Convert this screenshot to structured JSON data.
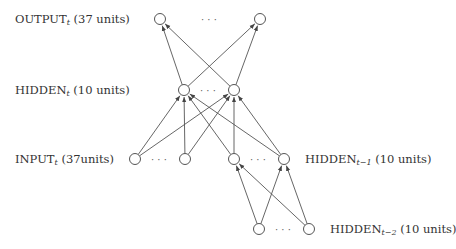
{
  "diagram": {
    "type": "recurrent-neural-network-architecture",
    "stroke_color": "#555555",
    "layers": [
      {
        "id": "output",
        "name": "OUTPUT",
        "subscript": "t",
        "suffix": "(37 units)",
        "nodes": [
          [
            160,
            19
          ],
          [
            260,
            19
          ]
        ],
        "dots": [
          210,
          19
        ],
        "label_pos": [
          15,
          12
        ]
      },
      {
        "id": "hidden_t",
        "name": "HIDDEN",
        "subscript": "t",
        "suffix": "(10 units)",
        "nodes": [
          [
            184,
            90
          ],
          [
            234,
            90
          ]
        ],
        "dots": [
          209,
          90
        ],
        "label_pos": [
          15,
          83
        ]
      },
      {
        "id": "input",
        "name": "INPUT",
        "subscript": "t",
        "suffix": "(37units)",
        "nodes": [
          [
            135,
            159
          ],
          [
            185,
            159
          ]
        ],
        "dots": [
          160,
          159
        ],
        "label_pos": [
          15,
          152
        ]
      },
      {
        "id": "hidden_t1",
        "name": "HIDDEN",
        "subscript": "t−1",
        "suffix": "(10 units)",
        "nodes": [
          [
            234,
            159
          ],
          [
            284,
            159
          ]
        ],
        "dots": [
          259,
          159
        ],
        "label_pos": [
          304,
          152
        ]
      },
      {
        "id": "hidden_t2",
        "name": "HIDDEN",
        "subscript": "t−2",
        "suffix": "(10 units)",
        "nodes": [
          [
            259,
            229
          ],
          [
            309,
            229
          ]
        ],
        "dots": [
          284,
          229
        ],
        "label_pos": [
          330,
          222
        ]
      }
    ],
    "edges": [
      {
        "from": [
          184,
          90
        ],
        "to": [
          160,
          19
        ]
      },
      {
        "from": [
          184,
          90
        ],
        "to": [
          260,
          19
        ]
      },
      {
        "from": [
          234,
          90
        ],
        "to": [
          160,
          19
        ]
      },
      {
        "from": [
          234,
          90
        ],
        "to": [
          260,
          19
        ]
      },
      {
        "from": [
          135,
          159
        ],
        "to": [
          184,
          90
        ]
      },
      {
        "from": [
          135,
          159
        ],
        "to": [
          234,
          90
        ]
      },
      {
        "from": [
          185,
          159
        ],
        "to": [
          184,
          90
        ]
      },
      {
        "from": [
          185,
          159
        ],
        "to": [
          234,
          90
        ]
      },
      {
        "from": [
          234,
          159
        ],
        "to": [
          184,
          90
        ]
      },
      {
        "from": [
          234,
          159
        ],
        "to": [
          234,
          90
        ]
      },
      {
        "from": [
          284,
          159
        ],
        "to": [
          184,
          90
        ]
      },
      {
        "from": [
          284,
          159
        ],
        "to": [
          234,
          90
        ]
      },
      {
        "from": [
          259,
          229
        ],
        "to": [
          234,
          159
        ]
      },
      {
        "from": [
          259,
          229
        ],
        "to": [
          284,
          159
        ]
      },
      {
        "from": [
          309,
          229
        ],
        "to": [
          234,
          159
        ]
      },
      {
        "from": [
          309,
          229
        ],
        "to": [
          284,
          159
        ]
      }
    ]
  },
  "labels": {
    "output": {
      "name": "OUTPUT",
      "sub": "t",
      "suffix": " (37 units)"
    },
    "hidden_t": {
      "name": "HIDDEN",
      "sub": "t",
      "suffix": " (10 units)"
    },
    "input": {
      "name": "INPUT",
      "sub": "t",
      "suffix": " (37units)"
    },
    "hidden_t1": {
      "name": "HIDDEN",
      "sub": "t−1",
      "suffix": " (10 units)"
    },
    "hidden_t2": {
      "name": "HIDDEN",
      "sub": "t−2",
      "suffix": " (10 units)"
    }
  },
  "ellipsis": "· · ·"
}
